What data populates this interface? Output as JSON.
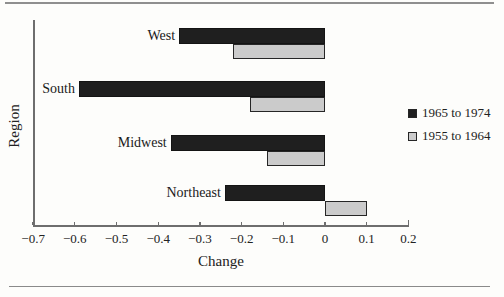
{
  "chart_data": {
    "type": "bar",
    "orientation": "horizontal",
    "title": "",
    "xlabel": "Change",
    "ylabel": "Region",
    "categories": [
      "West",
      "South",
      "Midwest",
      "Northeast"
    ],
    "series": [
      {
        "name": "1965 to 1974",
        "color": "#1f1f1f",
        "values": [
          -0.35,
          -0.59,
          -0.37,
          -0.24
        ]
      },
      {
        "name": "1955 to 1964",
        "color": "#cbcbcb",
        "values": [
          -0.22,
          -0.18,
          -0.14,
          0.1
        ]
      }
    ],
    "xlim": [
      -0.7,
      0.2
    ],
    "x_ticks": [
      -0.7,
      -0.6,
      -0.5,
      -0.4,
      -0.3,
      -0.2,
      -0.1,
      0,
      0.1,
      0.2
    ],
    "x_tick_labels": [
      "−0.7",
      "−0.6",
      "−0.5",
      "−0.4",
      "−0.3",
      "−0.2",
      "−0.1",
      "0",
      "0.1",
      "0.2"
    ],
    "grid": false,
    "legend_position": "right",
    "bar_border_color": "#262626"
  },
  "colors": {
    "background": "#fdfdfb",
    "axis": "#6e6e6e",
    "rule": "#8f8f8f",
    "text": "#222222"
  }
}
